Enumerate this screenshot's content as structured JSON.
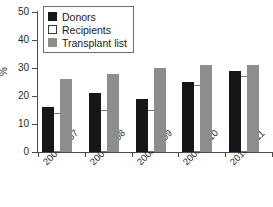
{
  "chart_data": {
    "type": "bar",
    "title": "",
    "xlabel": "",
    "ylabel": "%",
    "ylim": [
      0,
      50
    ],
    "yticks": [
      0,
      10,
      20,
      30,
      40,
      50
    ],
    "ytick_labels": [
      "0",
      "10",
      "20",
      "30",
      "40",
      "50"
    ],
    "grid": false,
    "legend_position": "top-left",
    "categories": [
      "2006-2007",
      "2007-2008",
      "2008-2009",
      "2009-2010",
      "2010-2011"
    ],
    "series": [
      {
        "name": "Donors",
        "color": "#161616",
        "values": [
          16,
          21,
          19,
          25,
          29
        ]
      },
      {
        "name": "Recipients",
        "color": "#ffffff",
        "values": [
          14,
          15,
          15,
          24,
          27
        ]
      },
      {
        "name": "Transplant list",
        "color": "#8d8d8d",
        "values": [
          26,
          28,
          30,
          31,
          31
        ]
      }
    ]
  },
  "legend": {
    "items": [
      {
        "label": "Donors",
        "swatch": "legend-swatch-donors"
      },
      {
        "label": "Recipients",
        "swatch": "legend-swatch-recipients"
      },
      {
        "label": "Transplant list",
        "swatch": "legend-swatch-transplant-list"
      }
    ]
  },
  "axes": {
    "y_title": "%",
    "y_tick_labels": [
      "50",
      "40",
      "30",
      "20",
      "10",
      "0"
    ],
    "x_tick_labels": [
      "2006-2007",
      "2007-2008",
      "2008-2009",
      "2009-2010",
      "2010-2011"
    ]
  }
}
